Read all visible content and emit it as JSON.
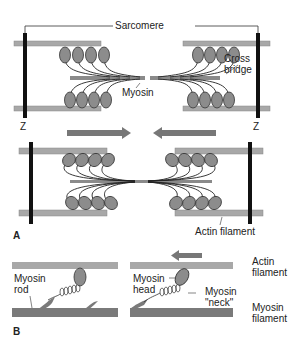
{
  "figure": {
    "panel_a": {
      "letter": "A",
      "labels": {
        "sarcomere": "Sarcomere",
        "cross_bridge_line1": "Cross",
        "cross_bridge_line2": "bridge",
        "myosin": "Myosin",
        "z_left": "Z",
        "z_right": "Z",
        "actin_filament": "Actin filament"
      }
    },
    "panel_b": {
      "letter": "B",
      "labels": {
        "myosin_rod_line1": "Myosin",
        "myosin_rod_line2": "rod",
        "myosin_head_line1": "Myosin",
        "myosin_head_line2": "head",
        "myosin_neck_line1": "Myosin",
        "myosin_neck_line2": "\"neck\"",
        "actin_line1": "Actin",
        "actin_line2": "filament",
        "myosin_fil_line1": "Myosin",
        "myosin_fil_line2": "filament"
      }
    },
    "colors": {
      "actin": "#a8a8a8",
      "myosin_head": "#8c8c8c",
      "z_line": "#111111",
      "arrow": "#777777",
      "myosin_filament": "#7a7a7a"
    }
  }
}
